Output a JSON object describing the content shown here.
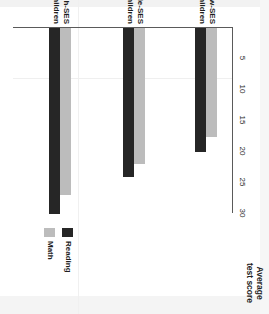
{
  "chart_data": {
    "type": "bar",
    "orientation": "horizontal",
    "title": "",
    "xlabel": "Average test score",
    "ylabel": "",
    "categories": [
      "Low-SES children",
      "Middle-SES children",
      "High-SES children"
    ],
    "series": [
      {
        "name": "Math",
        "color": "#bcbcbc",
        "values": [
          17.5,
          22,
          27
        ]
      },
      {
        "name": "Reading",
        "color": "#262626",
        "values": [
          20,
          24,
          30
        ]
      }
    ],
    "xlim": [
      0,
      30
    ],
    "xticks": [
      5,
      10,
      15,
      20,
      25,
      30
    ],
    "xtick_labels": [
      "5",
      "10",
      "15",
      "20",
      "25",
      "30"
    ],
    "grid": false,
    "legend_position": "right"
  },
  "axis": {
    "title_line1": "Average",
    "title_line2": "test score"
  },
  "categories": [
    {
      "line1": "Low-SES",
      "line2": "children"
    },
    {
      "line1": "Middle-SES",
      "line2": "children"
    },
    {
      "line1": "High-SES",
      "line2": "children"
    }
  ],
  "legend": {
    "reading_label": "Reading",
    "math_label": "Math"
  }
}
